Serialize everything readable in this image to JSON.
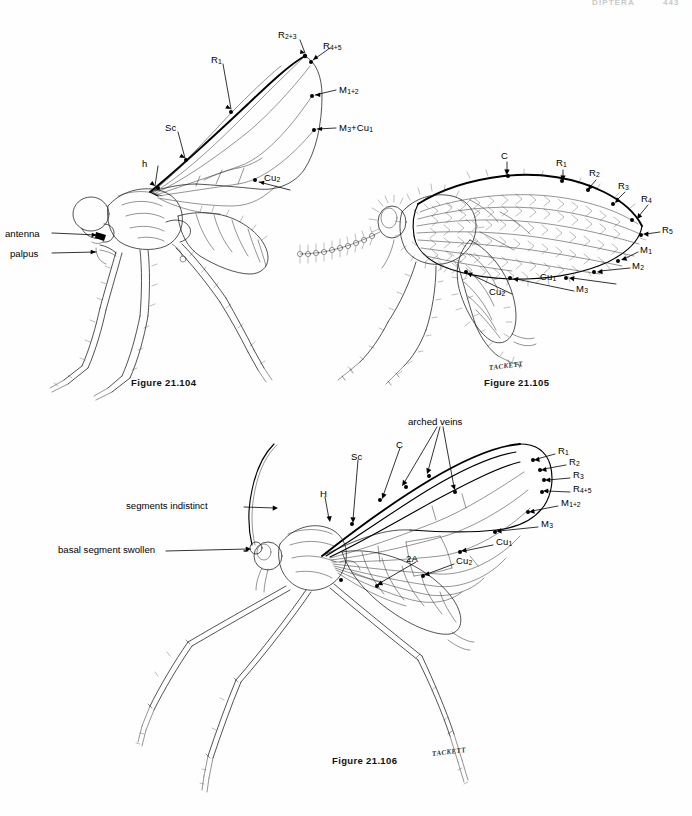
{
  "page": {
    "running_head": "DIPTERA",
    "page_number": "443",
    "background_color": "#ffffff",
    "ink_color": "#1a1a1a"
  },
  "figures": [
    {
      "id": "fig-21-104",
      "caption": "Figure 21.104",
      "subject": "adult fly, lateral view with wing venation",
      "signature": "",
      "wing_vein_labels": [
        {
          "name": "R2+3",
          "text": "R",
          "sub": "2+3"
        },
        {
          "name": "R4+5",
          "text": "R",
          "sub": "4+5"
        },
        {
          "name": "R1",
          "text": "R",
          "sub": "1"
        },
        {
          "name": "M1+2",
          "text": "M",
          "sub": "1+2"
        },
        {
          "name": "M3+Cu1",
          "text": "M",
          "sub": "3"
        },
        {
          "name": "Sc",
          "text": "Sc",
          "sub": ""
        },
        {
          "name": "h",
          "text": "h",
          "sub": ""
        },
        {
          "name": "Cu2",
          "text": "Cu",
          "sub": "2"
        }
      ],
      "body_labels": [
        {
          "name": "antenna",
          "text": "antenna"
        },
        {
          "name": "palpus",
          "text": "palpus"
        }
      ]
    },
    {
      "id": "fig-21-105",
      "caption": "Figure 21.105",
      "subject": "moth fly (Psychodidae) adult, lateral view with hairy wing",
      "signature": "TACKETT",
      "wing_vein_labels": [
        {
          "name": "C",
          "text": "C",
          "sub": ""
        },
        {
          "name": "R1",
          "text": "R",
          "sub": "1"
        },
        {
          "name": "R2",
          "text": "R",
          "sub": "2"
        },
        {
          "name": "R3",
          "text": "R",
          "sub": "3"
        },
        {
          "name": "R4",
          "text": "R",
          "sub": "4"
        },
        {
          "name": "R5",
          "text": "R",
          "sub": "5"
        },
        {
          "name": "M1",
          "text": "M",
          "sub": "1"
        },
        {
          "name": "M2",
          "text": "M",
          "sub": "2"
        },
        {
          "name": "M3",
          "text": "M",
          "sub": "3"
        },
        {
          "name": "Cu1",
          "text": "Cu",
          "sub": "1"
        },
        {
          "name": "Cu2",
          "text": "Cu",
          "sub": "2"
        }
      ],
      "body_labels": []
    },
    {
      "id": "fig-21-106",
      "caption": "Figure 21.106",
      "subject": "long-legged midge adult, lateral view with wing venation",
      "signature": "TACKETT",
      "wing_vein_labels": [
        {
          "name": "C",
          "text": "C",
          "sub": ""
        },
        {
          "name": "Sc",
          "text": "Sc",
          "sub": ""
        },
        {
          "name": "H",
          "text": "H",
          "sub": ""
        },
        {
          "name": "R1",
          "text": "R",
          "sub": "1"
        },
        {
          "name": "R2",
          "text": "R",
          "sub": "2"
        },
        {
          "name": "R3",
          "text": "R",
          "sub": "3"
        },
        {
          "name": "R4+5",
          "text": "R",
          "sub": "4+5"
        },
        {
          "name": "M1+2",
          "text": "M",
          "sub": "1+2"
        },
        {
          "name": "M3",
          "text": "M",
          "sub": "3"
        },
        {
          "name": "Cu1",
          "text": "Cu",
          "sub": "1"
        },
        {
          "name": "Cu2",
          "text": "Cu",
          "sub": "2"
        },
        {
          "name": "2A",
          "text": "2A",
          "sub": ""
        }
      ],
      "body_labels": [
        {
          "name": "arched-veins",
          "text": "arched veins"
        },
        {
          "name": "segments-indistinct",
          "text": "segments indistinct"
        },
        {
          "name": "basal-segment-swollen",
          "text": "basal segment swollen"
        }
      ]
    }
  ],
  "labels": {
    "f104": {
      "r23": "R",
      "r23_sub": "2+3",
      "r45": "R",
      "r45_sub": "4+5",
      "r1": "R",
      "r1_sub": "1",
      "m12": "M",
      "m12_sub": "1+2",
      "m3": "M",
      "m3_sub": "3",
      "m3cu1_tail": "+Cu",
      "m3cu1_tail_sub": "1",
      "sc": "Sc",
      "h": "h",
      "cu2": "Cu",
      "cu2_sub": "2",
      "antenna": "antenna",
      "palpus": "palpus",
      "caption": "Figure 21.104"
    },
    "f105": {
      "c": "C",
      "r1": "R",
      "r1_sub": "1",
      "r2": "R",
      "r2_sub": "2",
      "r3": "R",
      "r3_sub": "3",
      "r4": "R",
      "r4_sub": "4",
      "r5": "R",
      "r5_sub": "5",
      "m1": "M",
      "m1_sub": "1",
      "m2": "M",
      "m2_sub": "2",
      "m3": "M",
      "m3_sub": "3",
      "cu1": "Cu",
      "cu1_sub": "1",
      "cu2": "Cu",
      "cu2_sub": "2",
      "signature": "TACKETT",
      "caption": "Figure 21.105"
    },
    "f106": {
      "arched_veins": "arched veins",
      "c": "C",
      "sc": "Sc",
      "h": "H",
      "r1": "R",
      "r1_sub": "1",
      "r2": "R",
      "r2_sub": "2",
      "r3": "R",
      "r3_sub": "3",
      "r45": "R",
      "r45_sub": "4+5",
      "m12": "M",
      "m12_sub": "1+2",
      "m3": "M",
      "m3_sub": "3",
      "cu1": "Cu",
      "cu1_sub": "1",
      "cu2": "Cu",
      "cu2_sub": "2",
      "a2": "2A",
      "segments_indistinct": "segments indistinct",
      "basal_segment_swollen": "basal segment swollen",
      "signature": "TACKETT",
      "caption": "Figure 21.106"
    }
  }
}
